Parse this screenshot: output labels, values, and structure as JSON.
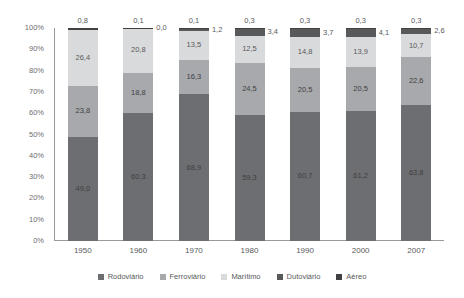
{
  "chart_data": {
    "type": "bar",
    "stacked": true,
    "stack_mode": "percent",
    "title": "",
    "subtitle": "",
    "xlabel": "",
    "ylabel": "",
    "ylim": [
      0,
      100
    ],
    "grid": false,
    "legend_position": "bottom",
    "categories": [
      "1950",
      "1960",
      "1970",
      "1980",
      "1990",
      "2000",
      "2007"
    ],
    "y_ticks": [
      "0%",
      "10%",
      "20%",
      "30%",
      "40%",
      "50%",
      "60%",
      "70%",
      "80%",
      "90%",
      "100%"
    ],
    "y_tick_values": [
      0,
      10,
      20,
      30,
      40,
      50,
      60,
      70,
      80,
      90,
      100
    ],
    "series": [
      {
        "name": "Rodoviário",
        "color": "#6d6e71",
        "values": [
          49.0,
          60.3,
          68.9,
          59.3,
          60.7,
          61.2,
          63.8
        ],
        "labels": [
          "49,0",
          "60,3",
          "68,9",
          "59,3",
          "60,7",
          "61,2",
          "63,8"
        ]
      },
      {
        "name": "Ferroviário",
        "color": "#a7a9ac",
        "values": [
          23.8,
          18.8,
          16.3,
          24.5,
          20.5,
          20.5,
          22.6
        ],
        "labels": [
          "23,8",
          "18,8",
          "16,3",
          "24,5",
          "20,5",
          "20,5",
          "22,6"
        ]
      },
      {
        "name": "Marítimo",
        "color": "#d9dadb",
        "values": [
          26.4,
          20.8,
          13.5,
          12.5,
          14.8,
          13.9,
          10.7
        ],
        "labels": [
          "26,4",
          "20,8",
          "13,5",
          "12,5",
          "14,8",
          "13,9",
          "10,7"
        ]
      },
      {
        "name": "Dutoviário",
        "color": "#58595b",
        "values": [
          0.0,
          0.0,
          1.2,
          3.4,
          3.7,
          4.1,
          2.6
        ],
        "labels": [
          "",
          "0,0",
          "1,2",
          "3,4",
          "3,7",
          "4,1",
          "2,6"
        ]
      },
      {
        "name": "Aéreo",
        "color": "#414042",
        "values": [
          0.8,
          0.1,
          0.1,
          0.3,
          0.3,
          0.3,
          0.3
        ],
        "labels": [
          "0,8",
          "0,1",
          "0,1",
          "0,3",
          "0,3",
          "0,3",
          "0,3"
        ]
      }
    ]
  },
  "legend": {
    "items": [
      {
        "label": "Rodoviário",
        "color": "#6d6e71"
      },
      {
        "label": "Ferroviário",
        "color": "#a7a9ac"
      },
      {
        "label": "Marítimo",
        "color": "#d9dadb"
      },
      {
        "label": "Dutoviário",
        "color": "#58595b"
      },
      {
        "label": "Aéreo",
        "color": "#414042"
      }
    ]
  }
}
